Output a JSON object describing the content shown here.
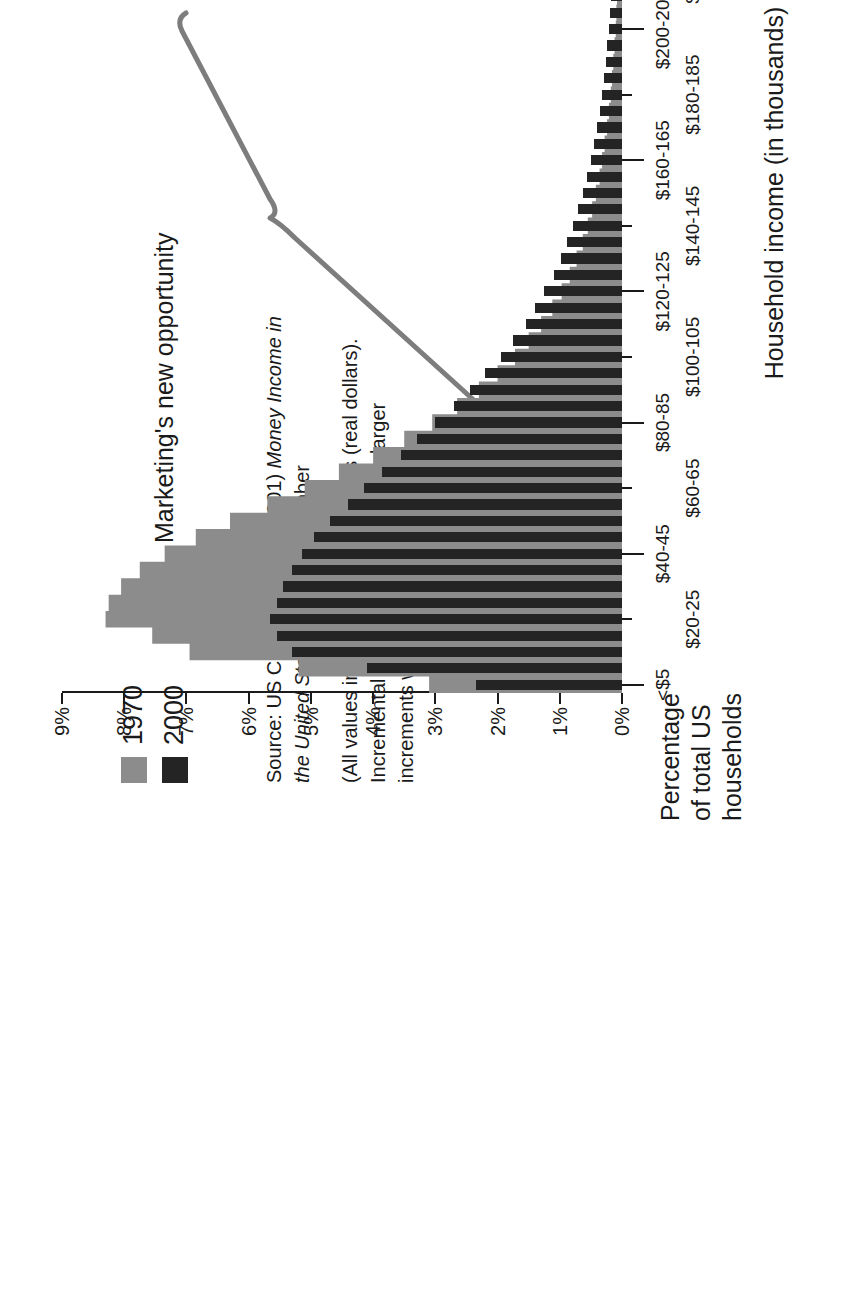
{
  "chart_data": {
    "type": "bar",
    "title": "",
    "xlabel": "Household income (in thousands)",
    "ylabel": "Percentage of total US households",
    "ylim": [
      0,
      9
    ],
    "ytick_labels": [
      "0%",
      "1%",
      "2%",
      "3%",
      "4%",
      "5%",
      "6%",
      "7%",
      "8%",
      "9%"
    ],
    "ytick_values": [
      0,
      1,
      2,
      3,
      4,
      5,
      6,
      7,
      8,
      9
    ],
    "grid": false,
    "legend_position": "top-left",
    "categories": [
      "<$5",
      "$5-10",
      "$10-15",
      "$15-20",
      "$20-25",
      "$25-30",
      "$30-35",
      "$35-40",
      "$40-45",
      "$45-50",
      "$50-55",
      "$55-60",
      "$60-65",
      "$65-70",
      "$70-75",
      "$75-80",
      "$80-85",
      "$85-90",
      "$90-95",
      "$95-100",
      "$100-105",
      "$105-110",
      "$110-115",
      "$115-120",
      "$120-125",
      "$125-130",
      "$130-135",
      "$135-140",
      "$140-145",
      "$145-150",
      "$150-155",
      "$155-160",
      "$160-165",
      "$165-170",
      "$170-175",
      "$175-180",
      "$180-185",
      "$185-190",
      "$190-195",
      "$195-200",
      "$200-205",
      "$205-210",
      "$210-215",
      "$215-220",
      "$220-225",
      "$225-230",
      "$230-235",
      "$235-240",
      "$240-245",
      "$245-250",
      "$250-255",
      "$255-260",
      "$260-265",
      "$265-270",
      "$270-275",
      "$275-280",
      "$280-285",
      "$285-290",
      "$290-295",
      "$295-300",
      ">$300"
    ],
    "xtick_labels_row1": [
      "<$5",
      "$20-25",
      "$40-45",
      "$60-65",
      "$80-85",
      "$100-105",
      "$120-125",
      "$140-145",
      "$160-165",
      "$180-185",
      "$200-205",
      "$220-225",
      "$240-245",
      "$260-265",
      "$280-285",
      ">$300"
    ],
    "series": [
      {
        "name": "1970",
        "color": "#8c8c8c",
        "style": "area",
        "values": [
          3.1,
          5.2,
          6.95,
          7.55,
          8.3,
          8.25,
          8.05,
          7.75,
          7.35,
          6.85,
          6.3,
          5.7,
          5.1,
          4.55,
          4.0,
          3.5,
          3.05,
          2.65,
          2.3,
          2.0,
          1.72,
          1.5,
          1.3,
          1.12,
          0.97,
          0.84,
          0.73,
          0.63,
          0.55,
          0.48,
          0.42,
          0.36,
          0.32,
          0.28,
          0.24,
          0.21,
          0.18,
          0.16,
          0.14,
          0.12,
          0.1,
          0.09,
          0.08,
          0.07,
          0.06,
          0.05,
          0.05,
          0.04,
          0.04,
          0.03,
          0.03,
          0.03,
          0.02,
          0.02,
          0.02,
          0.02,
          0.01,
          0.01,
          0.01,
          0.01,
          0.05
        ]
      },
      {
        "name": "2000",
        "color": "#242424",
        "style": "bars",
        "values": [
          2.35,
          4.1,
          5.3,
          5.55,
          5.65,
          5.55,
          5.45,
          5.3,
          5.15,
          4.95,
          4.7,
          4.4,
          4.15,
          3.85,
          3.55,
          3.3,
          3.0,
          2.7,
          2.45,
          2.2,
          1.95,
          1.75,
          1.55,
          1.4,
          1.25,
          1.1,
          0.98,
          0.88,
          0.78,
          0.7,
          0.62,
          0.56,
          0.5,
          0.45,
          0.4,
          0.36,
          0.32,
          0.29,
          0.26,
          0.24,
          0.21,
          0.19,
          0.17,
          0.16,
          0.14,
          0.13,
          0.12,
          0.11,
          0.1,
          0.09,
          0.08,
          0.08,
          0.07,
          0.06,
          0.06,
          0.05,
          0.05,
          0.04,
          0.04,
          0.04,
          0.62
        ]
      }
    ],
    "annotations": [
      {
        "text": "Marketing's new opportunity",
        "kind": "brace-callout",
        "span_categories": [
          "$60-65",
          "$180-185"
        ]
      }
    ]
  },
  "legend": {
    "items": [
      {
        "label": "1970",
        "color": "#8c8c8c"
      },
      {
        "label": "2000",
        "color": "#242424"
      }
    ]
  },
  "source": {
    "paragraph1_prefix": "Source: US Census Bureau (2001) ",
    "paragraph1_italic1": "Money Income in the United States: 2000",
    "paragraph1_suffix": ", September",
    "paragraph2": "(All values in 2000 CPI-U-RS dollars (real dollars). Incremental values interpolated from larger increments when not available)."
  },
  "axis_titles": {
    "x": "Household income (in thousands)",
    "y_line1": "Percentage",
    "y_line2": "of total US",
    "y_line3": "households"
  },
  "annotation": {
    "label": "Marketing's new opportunity"
  }
}
